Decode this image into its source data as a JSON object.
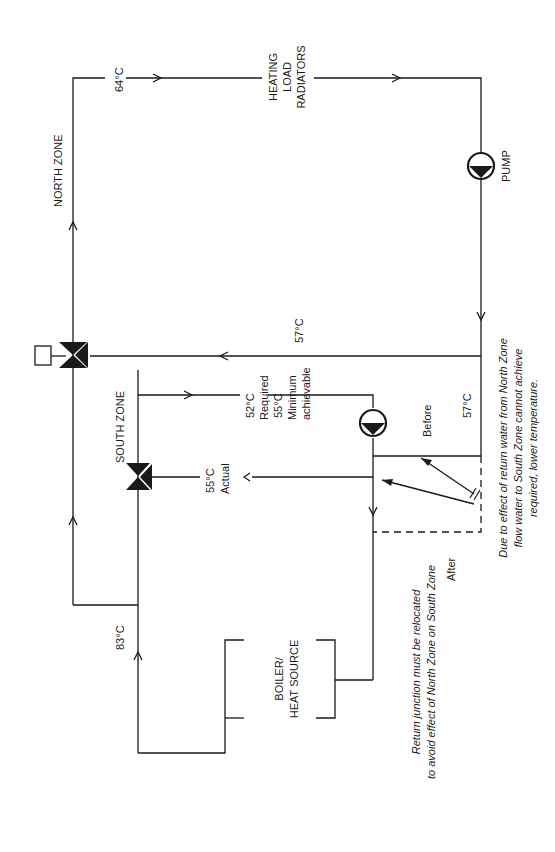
{
  "labels": {
    "north_zone": "NORTH ZONE",
    "south_zone": "SOUTH ZONE",
    "heating_load": [
      "HEATING",
      "LOAD",
      "RADIATORS"
    ],
    "pump": "PUMP",
    "boiler": [
      "BOILER/",
      "HEAT SOURCE"
    ],
    "temp_64": "64°C",
    "temp_83": "83°C",
    "temp_57_return": "57°C",
    "temp_57_before": "57°C",
    "temp_52": "52°C",
    "required": "Required",
    "temp_55_min": "55°C",
    "minimum": "Minimum",
    "achievable": "achievable",
    "temp_55_actual": "55°C",
    "actual": "Actual",
    "before": "Before",
    "after": "After"
  },
  "notes": {
    "effect": [
      "Due to effect of return water from North Zone",
      "flow water to South Zone cannot achieve",
      "required, lower temperature."
    ],
    "relocate": [
      "Return junction must be relocated",
      "to avoid effect of North Zone on South Zone"
    ]
  },
  "colors": {
    "line": "#1a1a1a",
    "background": "#ffffff"
  }
}
